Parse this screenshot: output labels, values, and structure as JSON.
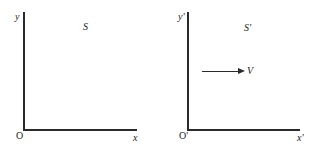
{
  "frames": [
    {
      "id": "S",
      "frame_label": "S",
      "y_label": "y",
      "x_label": "x",
      "origin_label": "O"
    },
    {
      "id": "S_prime",
      "frame_label": "S'",
      "y_label": "y'",
      "x_label": "x'",
      "origin_label": "O'",
      "velocity_label": "V"
    }
  ],
  "colors": {
    "ink": "#2a2a2a",
    "background": "#ffffff"
  }
}
